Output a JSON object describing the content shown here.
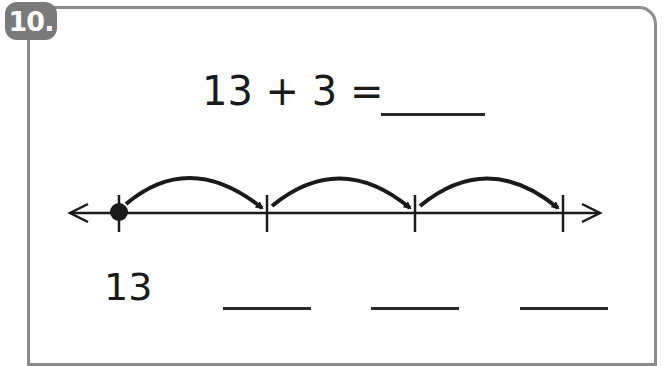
{
  "problem": {
    "number": "10.",
    "equation": "13 + 3 =",
    "answer_blank": "",
    "start_value": "13",
    "jump_blanks": [
      "",
      "",
      ""
    ]
  },
  "number_line": {
    "start": 13,
    "jumps": 3,
    "jump_size": 1,
    "tick_positions_px": [
      119,
      267,
      415,
      563
    ],
    "ticks": [
      13,
      14,
      15,
      16
    ],
    "start_dot": true
  },
  "colors": {
    "badge": "#7a7a7a",
    "frame": "#8c8c8c",
    "ink": "#1a1a1a"
  }
}
